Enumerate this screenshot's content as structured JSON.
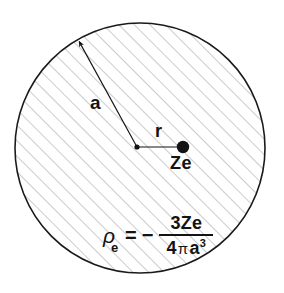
{
  "figure": {
    "background_color": "#ffffff",
    "outline_color": "#1a1a1a",
    "hatch_color": "#b9b9bd",
    "ink_color": "#131313"
  },
  "sphere": {
    "center_x": 140,
    "center_y": 148,
    "radius": 125,
    "hatch_angle_deg": 45,
    "hatch_spacing_px": 11,
    "outline_width_px": 1.6
  },
  "labels": {
    "radius": "a",
    "distance": "r",
    "nucleus": "Ze"
  },
  "markers": {
    "center_dot_radius": 2.6,
    "nucleus_dot_radius": 6.2,
    "nucleus_x": 183,
    "nucleus_y": 147
  },
  "radius_arrow": {
    "from_x": 137,
    "from_y": 147,
    "to_x": 77,
    "to_y": 39
  },
  "r_segment": {
    "from_x": 139,
    "from_y": 147,
    "to_x": 178,
    "to_y": 147
  },
  "formula": {
    "symbol": "ρ",
    "subscript": "e",
    "equals": "=",
    "minus": "−",
    "numerator": "3Ze",
    "denominator_lead": "4",
    "denominator_pi": "π",
    "denominator_var": "a",
    "denominator_exponent": "3",
    "plain_text": "ρe = − 3Ze / (4πa³)"
  }
}
